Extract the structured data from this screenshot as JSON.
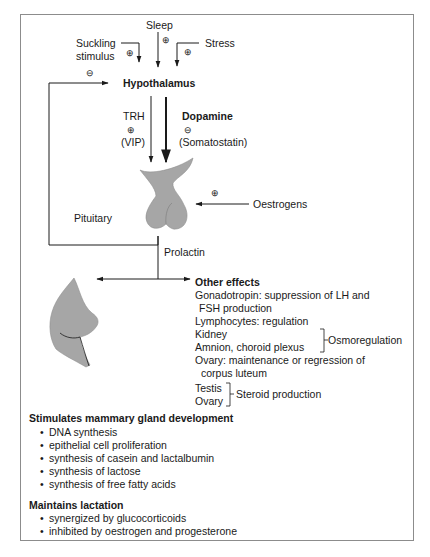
{
  "diagram": {
    "inputs": {
      "sleep": "Sleep",
      "suckling_line1": "Suckling",
      "suckling_line2": "stimulus",
      "stress": "Stress",
      "plus": "⊕",
      "minus": "⊖"
    },
    "hypothalamus": "Hypothalamus",
    "trh": "TRH",
    "vip": "(VIP)",
    "dopamine": "Dopamine",
    "somatostatin": "(Somatostatin)",
    "pituitary": "Pituitary",
    "oestrogens": "Oestrogens",
    "prolactin": "Prolactin",
    "other_effects": {
      "title": "Other effects",
      "lines": [
        "Gonadotropin: suppression of LH and",
        "FSH production",
        "Lymphocytes: regulation",
        "Kidney",
        "Amnion, choroid plexus",
        "Ovary: maintenance or regression of",
        "corpus luteum",
        "Testis",
        "Ovary"
      ],
      "osmoregulation": "Osmoregulation",
      "steroid_production": "Steroid production"
    },
    "mammary": {
      "title": "Stimulates mammary gland development",
      "items": [
        "DNA synthesis",
        "epithelial cell proliferation",
        "synthesis of casein and lactalbumin",
        "synthesis of lactose",
        "synthesis of free fatty acids"
      ]
    },
    "lactation": {
      "title": "Maintains lactation",
      "items": [
        "synergized by glucocorticoids",
        "inhibited by oestrogen and progesterone"
      ]
    },
    "bullet": "•",
    "colors": {
      "organ_fill": "#a6a6a6",
      "line": "#1a1a1a",
      "border": "#8c8c8c"
    }
  }
}
